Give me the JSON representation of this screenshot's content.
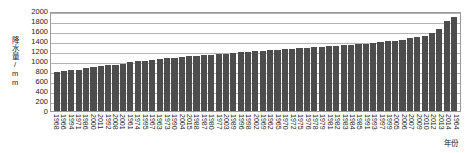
{
  "chart_data": {
    "type": "bar",
    "title": "",
    "xlabel": "年份",
    "ylabel": "降水量/mm",
    "ylim": [
      0,
      2000
    ],
    "yticks": [
      0,
      200,
      400,
      600,
      800,
      1000,
      1200,
      1400,
      1600,
      1800,
      2000
    ],
    "grid": true,
    "legend": "none",
    "sorted": "ascending",
    "bar_color": "#4d4d4d",
    "categories": [
      "1968",
      "1966",
      "1994",
      "1971",
      "1986",
      "2000",
      "2011",
      "1992",
      "2008",
      "2001",
      "1961",
      "1974",
      "1995",
      "1967",
      "1963",
      "1973",
      "1990",
      "2004",
      "2015",
      "1988",
      "1987",
      "1980",
      "1977",
      "2003",
      "1989",
      "1996",
      "1998",
      "2002",
      "1969",
      "1962",
      "1965",
      "1970",
      "1972",
      "1975",
      "1976",
      "1978",
      "1979",
      "1981",
      "1982",
      "1983",
      "1984",
      "1985",
      "1991",
      "1993",
      "1997",
      "1999",
      "2005",
      "2006",
      "2007",
      "2009",
      "2010",
      "2012",
      "2013",
      "2014",
      "1964"
    ],
    "values": [
      790,
      800,
      815,
      830,
      860,
      885,
      900,
      915,
      930,
      945,
      980,
      1000,
      1010,
      1025,
      1040,
      1055,
      1065,
      1080,
      1095,
      1110,
      1120,
      1130,
      1140,
      1150,
      1160,
      1175,
      1185,
      1195,
      1205,
      1215,
      1225,
      1235,
      1245,
      1255,
      1265,
      1280,
      1290,
      1300,
      1310,
      1320,
      1330,
      1340,
      1350,
      1365,
      1380,
      1395,
      1410,
      1430,
      1455,
      1480,
      1510,
      1560,
      1650,
      1800,
      1890
    ]
  }
}
